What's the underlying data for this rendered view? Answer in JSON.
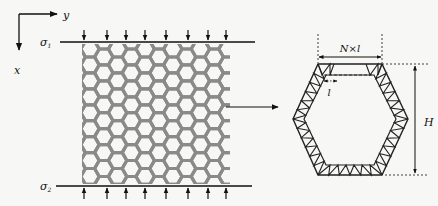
{
  "figure": {
    "axes": {
      "x_label": "x",
      "y_label": "y"
    },
    "loads": {
      "top_label": "σ",
      "top_subscript": "1",
      "bottom_label": "σ",
      "bottom_subscript": "2",
      "top_arrow_count": 8,
      "bottom_arrow_count": 8
    },
    "lattice": {
      "description": "honeycomb lattice",
      "rows": 8,
      "cols": 7,
      "color": "#8a8a8a"
    },
    "detail": {
      "width_label": "N×l",
      "segment_label": "l",
      "height_label": "H",
      "truss_color": "#222222"
    }
  }
}
